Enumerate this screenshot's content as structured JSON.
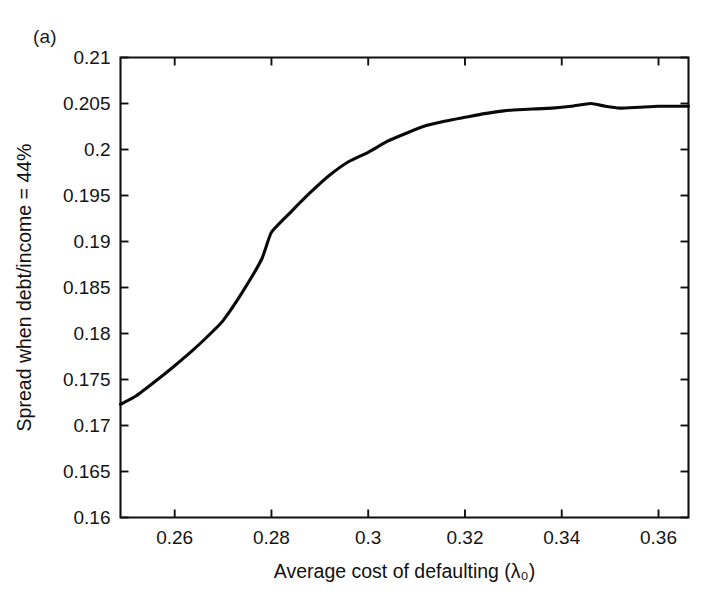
{
  "figure": {
    "panel_label": "(a)",
    "background_color": "#ffffff",
    "line_color": "#090909",
    "axis_color": "#101010"
  },
  "chart_data": {
    "type": "line",
    "title": "",
    "subtitle": "",
    "xlabel": "Average cost of defaulting (λ₀)",
    "ylabel": "Spread when debt/income = 44%",
    "xlim": [
      0.2488,
      0.3662
    ],
    "ylim": [
      0.16,
      0.21
    ],
    "xticks": [
      0.26,
      0.28,
      0.3,
      0.32,
      0.34,
      0.36
    ],
    "xticklabels": [
      "0.26",
      "0.28",
      "0.3",
      "0.32",
      "0.34",
      "0.36"
    ],
    "yticks": [
      0.16,
      0.165,
      0.17,
      0.175,
      0.18,
      0.185,
      0.19,
      0.195,
      0.2,
      0.205,
      0.21
    ],
    "yticklabels": [
      "0.16",
      "0.165",
      "0.17",
      "0.175",
      "0.18",
      "0.185",
      "0.19",
      "0.195",
      "0.2",
      "0.205",
      "0.21"
    ],
    "grid": false,
    "legend": false,
    "legend_position": "none",
    "annotations": [
      "(a)"
    ],
    "series": [
      {
        "name": "Spread",
        "x": [
          0.2488,
          0.252,
          0.256,
          0.26,
          0.264,
          0.268,
          0.27,
          0.274,
          0.278,
          0.28,
          0.284,
          0.288,
          0.292,
          0.296,
          0.3,
          0.304,
          0.308,
          0.312,
          0.316,
          0.32,
          0.324,
          0.328,
          0.33,
          0.334,
          0.338,
          0.342,
          0.346,
          0.349,
          0.352,
          0.356,
          0.36,
          0.364,
          0.3662
        ],
        "y": [
          0.1723,
          0.1732,
          0.1748,
          0.1765,
          0.1783,
          0.1803,
          0.1814,
          0.1845,
          0.1881,
          0.191,
          0.1932,
          0.1953,
          0.1972,
          0.1987,
          0.1997,
          0.2009,
          0.2018,
          0.2026,
          0.2031,
          0.2035,
          0.2039,
          0.2042,
          0.2043,
          0.2044,
          0.2045,
          0.2047,
          0.205,
          0.2047,
          0.2045,
          0.2046,
          0.2047,
          0.2047,
          0.2047
        ]
      }
    ]
  }
}
